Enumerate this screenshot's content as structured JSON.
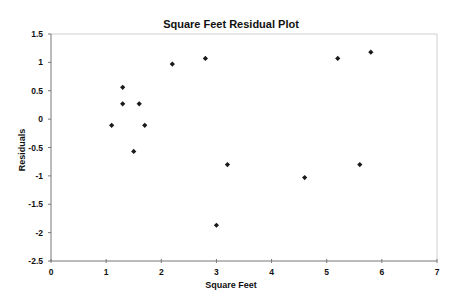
{
  "chart_data": {
    "type": "scatter",
    "title": "Square Feet  Residual Plot",
    "xlabel": "Square Feet",
    "ylabel": "Residuals",
    "xlim": [
      0,
      7
    ],
    "ylim": [
      -2.5,
      1.5
    ],
    "x_ticks": [
      0,
      1,
      2,
      3,
      4,
      5,
      6,
      7
    ],
    "y_ticks": [
      1.5,
      1,
      0.5,
      0,
      -0.5,
      -1,
      -1.5,
      -2,
      -2.5
    ],
    "x_tick_labels": [
      "0",
      "1",
      "2",
      "3",
      "4",
      "5",
      "6",
      "7"
    ],
    "y_tick_labels": [
      "1.5",
      "1",
      "0.5",
      "0",
      "-0.5",
      "-1",
      "-1.5",
      "-2",
      "-2.5"
    ],
    "grid": false,
    "legend": "none",
    "marker": "diamond",
    "marker_color": "#1a1a1a",
    "points": [
      {
        "x": 1.1,
        "y": -0.11
      },
      {
        "x": 1.3,
        "y": 0.56
      },
      {
        "x": 1.3,
        "y": 0.27
      },
      {
        "x": 1.5,
        "y": -0.57
      },
      {
        "x": 1.6,
        "y": 0.27
      },
      {
        "x": 1.7,
        "y": -0.11
      },
      {
        "x": 2.2,
        "y": 0.97
      },
      {
        "x": 2.8,
        "y": 1.07
      },
      {
        "x": 3.0,
        "y": -1.87
      },
      {
        "x": 3.2,
        "y": -0.8
      },
      {
        "x": 4.6,
        "y": -1.03
      },
      {
        "x": 5.2,
        "y": 1.07
      },
      {
        "x": 5.6,
        "y": -0.8
      },
      {
        "x": 5.8,
        "y": 1.18
      }
    ]
  }
}
